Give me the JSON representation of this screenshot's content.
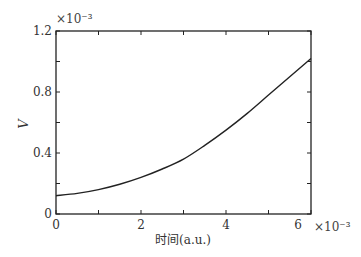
{
  "chart_data": {
    "type": "line",
    "title": "",
    "xlabel": "时间(a.u.)",
    "ylabel": "V",
    "x_multiplier": "×10⁻³",
    "y_multiplier": "×10⁻³",
    "xlim": [
      0,
      6
    ],
    "ylim": [
      0,
      1.2
    ],
    "x_ticks": [
      0,
      1,
      2,
      3,
      4,
      5,
      6
    ],
    "x_tick_labels": [
      "0",
      "2",
      "4",
      "6"
    ],
    "x_tick_label_values": [
      0,
      2,
      4,
      6
    ],
    "y_ticks": [
      0,
      0.2,
      0.4,
      0.6,
      0.8,
      1.0,
      1.2
    ],
    "y_tick_labels": [
      "0",
      "0.4",
      "0.8",
      "1.2"
    ],
    "y_tick_label_values": [
      0,
      0.4,
      0.8,
      1.2
    ],
    "grid": false,
    "legend": null,
    "series": [
      {
        "name": "V",
        "x": [
          0,
          0.5,
          1,
          1.5,
          2,
          2.5,
          3,
          3.5,
          4,
          4.5,
          5,
          5.5,
          6
        ],
        "values": [
          0.12,
          0.135,
          0.16,
          0.195,
          0.24,
          0.295,
          0.36,
          0.45,
          0.55,
          0.66,
          0.78,
          0.9,
          1.02
        ],
        "color": "#222222"
      }
    ]
  }
}
